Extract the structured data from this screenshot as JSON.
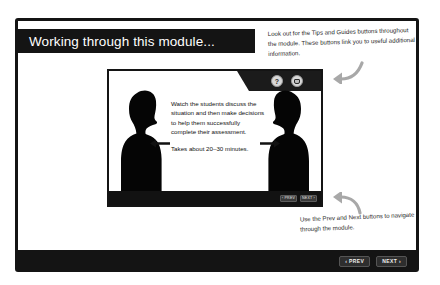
{
  "slide": {
    "title": "Working through this module...",
    "prev_label": "‹ PREV",
    "next_label": "NEXT ›"
  },
  "module_screenshot": {
    "tips_icon": "question-mark-icon",
    "tips_glyph": "?",
    "guides_icon": "guide-book-icon",
    "body_paragraph_1": "Watch the students discuss the situation and then make decisions to help them successfully complete their assessment.",
    "body_paragraph_2": "Takes about 20–30 minutes.",
    "left_arrow_icon": "arrow-left-icon",
    "right_arrow_icon": "arrow-right-icon",
    "left_figure": "student-silhouette-left",
    "right_figure": "student-silhouette-right",
    "mini_prev_label": "‹ PREV",
    "mini_next_label": "NEXT ›"
  },
  "annotations": {
    "top": "Look out for the Tips and Guides buttons throughout the module. These buttons link you to useful additional information.",
    "bottom": "Use the Prev and Next buttons to navigate through the module.",
    "top_arrow_icon": "curved-arrow-up-left-icon",
    "bottom_arrow_icon": "curved-arrow-up-left-icon"
  },
  "colors": {
    "frame": "#141414",
    "page_background": "#ffffff",
    "annotation_arrow": "#a8a8a8",
    "title_text": "#ffffff"
  }
}
